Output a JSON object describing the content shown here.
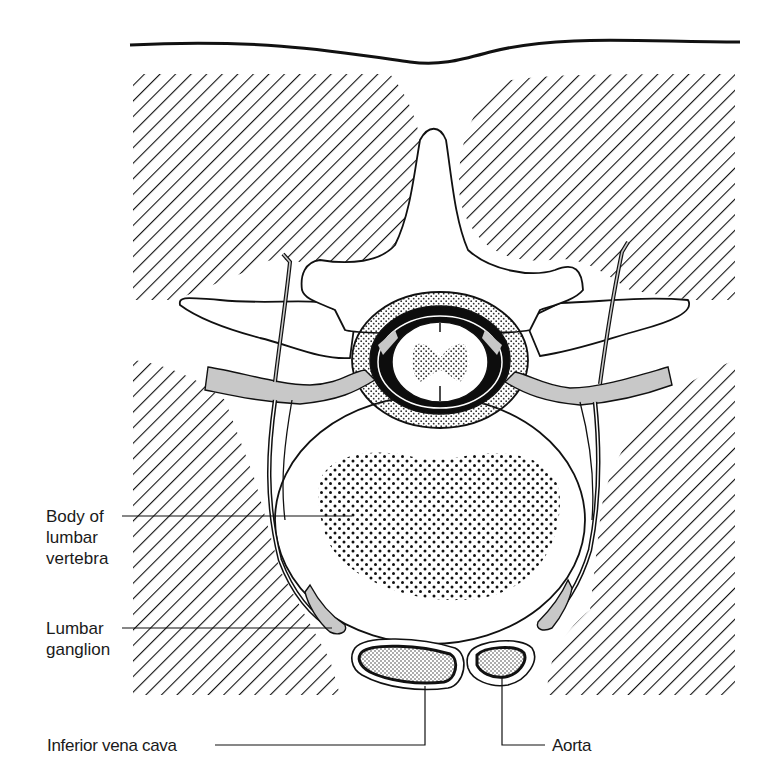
{
  "figure": {
    "colors": {
      "line": "#111111",
      "hatch": "#111111",
      "nerve_fill": "#c8c8c8",
      "background": "#ffffff",
      "dura": "#0d0d0d"
    }
  },
  "labels": {
    "body_of_lumbar_vertebra": "Body of\nlumbar\nvertebra",
    "lumbar_ganglion": "Lumbar\nganglion",
    "inferior_vena_cava": "Inferior vena cava",
    "aorta": "Aorta"
  }
}
